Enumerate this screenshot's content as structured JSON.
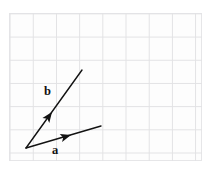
{
  "figure": {
    "background_color": "#ffffff",
    "paper_color": "#fdfdfd",
    "grid_line_color": "#e2e2e4",
    "ink_color": "#121212",
    "grid": {
      "cell_size_px": 23.2,
      "columns": 8,
      "rows": 6,
      "visible": true
    }
  },
  "chart_data": {
    "type": "scatter",
    "title": "",
    "xlabel": "",
    "ylabel": "",
    "grid": true,
    "legend_position": "none",
    "annotations": [
      "a",
      "b"
    ],
    "origin": {
      "x": 26,
      "y": 148
    },
    "vectors": [
      {
        "name": "a",
        "label": "a",
        "label_x": 52,
        "label_y": 144,
        "start_x": 26,
        "start_y": 148,
        "end_x": 101,
        "end_y": 126,
        "arrowhead_x": 71,
        "arrowhead_y": 135,
        "arrowhead_position": "midshaft",
        "color": "#121212",
        "line_width": 1.4
      },
      {
        "name": "b",
        "label": "b",
        "label_x": 44,
        "label_y": 85,
        "start_x": 26,
        "start_y": 148,
        "end_x": 82,
        "end_y": 70,
        "arrowhead_x": 52,
        "arrowhead_y": 112,
        "arrowhead_position": "midshaft",
        "color": "#121212",
        "line_width": 1.4
      }
    ]
  }
}
